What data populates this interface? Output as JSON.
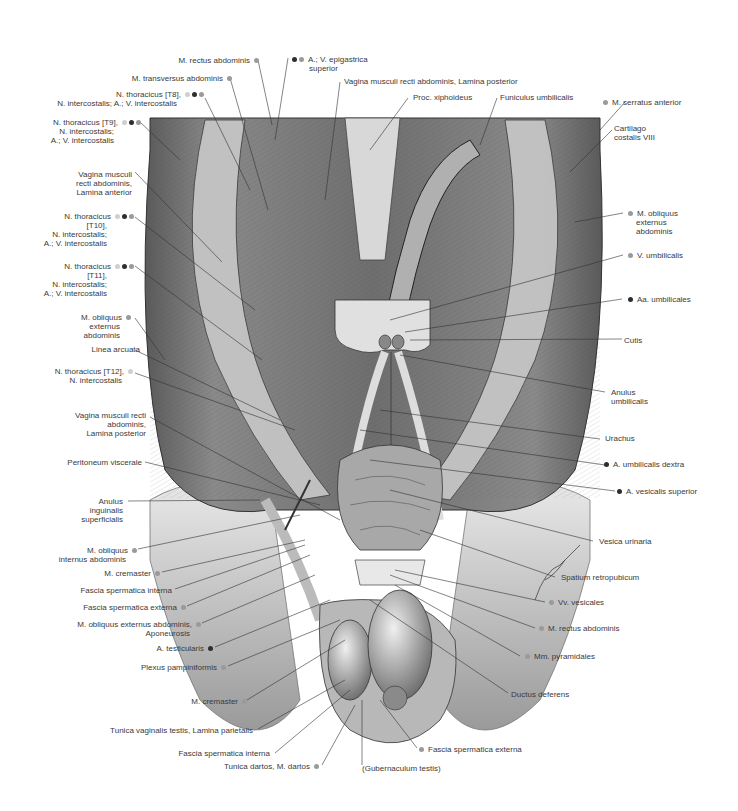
{
  "figure": {
    "legend_dot_colors": {
      "nerve": "#cfcfcf",
      "artery": "#2e2e2e",
      "vein": "#9a9a9a",
      "muscle": "#9a9a9a"
    },
    "signature": "Lemier",
    "labels_left": [
      {
        "id": "m-rectus-abdominis-top",
        "lines": [
          "M. rectus abdominis"
        ],
        "dots": [
          "muscle"
        ]
      },
      {
        "id": "m-transversus-abdominis",
        "lines": [
          "M. transversus abdominis"
        ],
        "dots": [
          "muscle"
        ]
      },
      {
        "id": "n-thoracicus-t8",
        "lines": [
          "N. thoracicus [T8],",
          "N. intercostalis; A.; V. intercostalis"
        ],
        "dots": [
          "nerve",
          "artery",
          "vein"
        ]
      },
      {
        "id": "n-thoracicus-t9",
        "lines": [
          "N. thoracicus [T9],",
          "N. intercostalis;",
          "A.; V. intercostalis"
        ],
        "dots": [
          "nerve",
          "artery",
          "vein"
        ]
      },
      {
        "id": "vagina-lamina-anterior",
        "lines": [
          "Vagina musculi",
          "recti abdominis,",
          "Lamina anterior"
        ],
        "dots": []
      },
      {
        "id": "n-thoracicus-t10",
        "lines": [
          "N. thoracicus",
          "[T10],",
          "N. intercostalis;",
          "A.; V. intercostalis"
        ],
        "dots": [
          "nerve",
          "artery",
          "vein"
        ]
      },
      {
        "id": "n-thoracicus-t11",
        "lines": [
          "N. thoracicus",
          "[T11],",
          "N. intercostalis;",
          "A.; V. intercostalis"
        ],
        "dots": [
          "nerve",
          "artery",
          "vein"
        ]
      },
      {
        "id": "m-obliquus-externus-left",
        "lines": [
          "M. obliquus",
          "externus",
          "abdominis"
        ],
        "dots": [
          "muscle"
        ]
      },
      {
        "id": "linea-arcuata",
        "lines": [
          "Linea arcuata"
        ],
        "dots": []
      },
      {
        "id": "n-thoracicus-t12",
        "lines": [
          "N. thoracicus [T12],",
          "N. intercostalis"
        ],
        "dots": [
          "nerve"
        ]
      },
      {
        "id": "vagina-lamina-posterior-left",
        "lines": [
          "Vagina musculi recti",
          "abdominis,",
          "Lamina posterior"
        ],
        "dots": []
      },
      {
        "id": "peritoneum-viscerale",
        "lines": [
          "Peritoneum viscerale"
        ],
        "dots": []
      },
      {
        "id": "anulus-inguinalis",
        "lines": [
          "Anulus",
          "inguinalis",
          "superficialis"
        ],
        "dots": []
      },
      {
        "id": "m-obliquus-internus",
        "lines": [
          "M. obliquus",
          "internus abdominis"
        ],
        "dots": [
          "muscle"
        ]
      },
      {
        "id": "m-cremaster-1",
        "lines": [
          "M. cremaster"
        ],
        "dots": [
          "muscle"
        ]
      },
      {
        "id": "fascia-spermatica-interna-1",
        "lines": [
          "Fascia spermatica interna"
        ],
        "dots": []
      },
      {
        "id": "fascia-spermatica-externa-1",
        "lines": [
          "Fascia spermatica externa"
        ],
        "dots": [
          "muscle"
        ]
      },
      {
        "id": "m-obliquus-externus-aponeurosis",
        "lines": [
          "M. obliquus externus abdominis,",
          "Aponeurosis"
        ],
        "dots": [
          "muscle"
        ]
      },
      {
        "id": "a-testicularis",
        "lines": [
          "A. testicularis"
        ],
        "dots": [
          "artery"
        ]
      },
      {
        "id": "plexus-pampiniformis",
        "lines": [
          "Plexus pampiniformis"
        ],
        "dots": [
          "vein"
        ]
      },
      {
        "id": "m-cremaster-2",
        "lines": [
          "M. cremaster"
        ],
        "dots": [
          "muscle"
        ]
      },
      {
        "id": "tunica-vaginalis",
        "lines": [
          "Tunica vaginalis testis, Lamina parietalis"
        ],
        "dots": []
      },
      {
        "id": "fascia-spermatica-interna-2",
        "lines": [
          "Fascia spermatica interna"
        ],
        "dots": []
      },
      {
        "id": "tunica-dartos",
        "lines": [
          "Tunica dartos, M. dartos"
        ],
        "dots": [
          "muscle"
        ]
      }
    ],
    "labels_top": [
      {
        "id": "a-v-epigastrica-superior",
        "lines": [
          "A.; V. epigastrica",
          "superior"
        ],
        "dots": [
          "artery",
          "vein"
        ]
      },
      {
        "id": "vagina-lamina-posterior-top",
        "lines": [
          "Vagina musculi recti abdominis, Lamina posterior"
        ],
        "dots": []
      },
      {
        "id": "proc-xiphoideus",
        "lines": [
          "Proc. xiphoideus"
        ],
        "dots": []
      },
      {
        "id": "funiculus-umbilicalis",
        "lines": [
          "Funiculus umbilicalis"
        ],
        "dots": []
      }
    ],
    "labels_right": [
      {
        "id": "m-serratus-anterior",
        "lines": [
          "M. serratus anterior"
        ],
        "dots": [
          "muscle"
        ]
      },
      {
        "id": "cartilago-costalis-viii",
        "lines": [
          "Cartilago",
          "costalis VIII"
        ],
        "dots": []
      },
      {
        "id": "m-obliquus-externus-right",
        "lines": [
          "M. obliquus",
          "externus",
          "abdominis"
        ],
        "dots": [
          "muscle"
        ]
      },
      {
        "id": "v-umbilicalis",
        "lines": [
          "V. umbilicalis"
        ],
        "dots": [
          "vein"
        ]
      },
      {
        "id": "aa-umbilicales",
        "lines": [
          "Aa. umbilicales"
        ],
        "dots": [
          "artery"
        ]
      },
      {
        "id": "cutis",
        "lines": [
          "Cutis"
        ],
        "dots": []
      },
      {
        "id": "anulus-umbilicalis",
        "lines": [
          "Anulus",
          "umbilicalis"
        ],
        "dots": []
      },
      {
        "id": "urachus",
        "lines": [
          "Urachus"
        ],
        "dots": []
      },
      {
        "id": "a-umbilicalis-dextra",
        "lines": [
          "A. umbilicalis dextra"
        ],
        "dots": [
          "artery"
        ]
      },
      {
        "id": "a-vesicalis-superior",
        "lines": [
          "A. vesicalis superior"
        ],
        "dots": [
          "artery"
        ]
      },
      {
        "id": "vesica-urinaria",
        "lines": [
          "Vesica urinaria"
        ],
        "dots": []
      },
      {
        "id": "spatium-retropubicum",
        "lines": [
          "Spatium retropubicum"
        ],
        "dots": []
      },
      {
        "id": "vv-vesicales",
        "lines": [
          "Vv. vesicales"
        ],
        "dots": [
          "vein"
        ]
      },
      {
        "id": "m-rectus-abdominis-bottom",
        "lines": [
          "M. rectus abdominis"
        ],
        "dots": [
          "muscle"
        ]
      },
      {
        "id": "mm-pyramidales",
        "lines": [
          "Mm. pyramidales"
        ],
        "dots": [
          "muscle"
        ]
      },
      {
        "id": "ductus-deferens",
        "lines": [
          "Ductus deferens"
        ],
        "dots": []
      }
    ],
    "labels_bottom": [
      {
        "id": "gubernaculum-testis",
        "lines": [
          "(Gubernaculum testis)"
        ],
        "dots": []
      },
      {
        "id": "fascia-spermatica-externa-2",
        "lines": [
          "Fascia spermatica externa"
        ],
        "dots": [
          "muscle"
        ]
      }
    ]
  }
}
